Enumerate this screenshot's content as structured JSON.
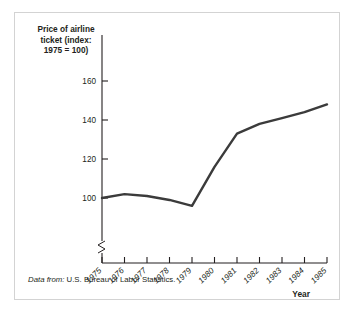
{
  "figure": {
    "source_note_prefix": "Data from:",
    "source_note_text": " U.S. Bureau of Labor Statistics.",
    "line_color": "#3b3b3b",
    "axis_color": "#231f20",
    "frame_color": "#d3d3d3"
  },
  "chart_data": {
    "type": "line",
    "title": "",
    "ylabel": "Price of airline\nticket (index:\n1975 = 100)",
    "xlabel": "Year",
    "categories": [
      "1975",
      "1976",
      "1977",
      "1978",
      "1979",
      "1980",
      "1981",
      "1982",
      "1983",
      "1984",
      "1985"
    ],
    "x": [
      1975,
      1976,
      1977,
      1978,
      1979,
      1980,
      1981,
      1982,
      1983,
      1984,
      1985
    ],
    "values": [
      100,
      102,
      101,
      99,
      96,
      116,
      133,
      138,
      141,
      144,
      148
    ],
    "series": [
      {
        "name": "Price of airline ticket (index: 1975 = 100)",
        "values": [
          100,
          102,
          101,
          99,
          96,
          116,
          133,
          138,
          141,
          144,
          148
        ]
      }
    ],
    "yticks": [
      100,
      120,
      140,
      160
    ],
    "ytick_labels": [
      "100",
      "120",
      "140",
      "160"
    ],
    "xtick_labels": [
      "1975",
      "1976",
      "1977",
      "1978",
      "1979",
      "1980",
      "1981",
      "1982",
      "1983",
      "1984",
      "1985"
    ],
    "ylim": [
      88,
      168
    ],
    "xlim": [
      1975,
      1985
    ],
    "grid": false,
    "legend": false,
    "axis_break_y": true,
    "axis_break_note": "zigzag break on y-axis below 100"
  },
  "labels": {
    "y_axis_title": "Price of airline\nticket (index:\n1975 = 100)",
    "x_axis_title": "Year"
  }
}
